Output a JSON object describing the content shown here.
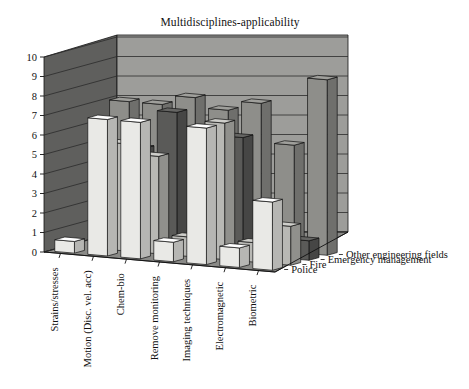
{
  "chart": {
    "title": "Multidisciplines-applicability",
    "type": "bar"
  },
  "chart_data": {
    "type": "bar",
    "title": "Multidisciplines-applicability",
    "xlabel": "",
    "ylabel": "",
    "ylim": [
      0,
      10
    ],
    "yticks": [
      0,
      1,
      2,
      3,
      4,
      5,
      6,
      7,
      8,
      9,
      10
    ],
    "grid": true,
    "projection": "3d",
    "legend_position": "right-depth-axis",
    "categories": [
      "Strains/stresses",
      "Motion (Disc. vel. acc)",
      "Chem-bio",
      "Remove monitoring",
      "Imaging techniques",
      "Electromagnetic",
      "Biometric"
    ],
    "series": [
      {
        "name": "Police",
        "color": "#e9e9e6",
        "values": [
          0.6,
          7.0,
          7.0,
          1.0,
          7.0,
          1.0,
          3.5
        ]
      },
      {
        "name": "Fire",
        "color": "#b8b8b4",
        "values": [
          0.0,
          5.5,
          5.0,
          1.0,
          7.0,
          1.0,
          2.0
        ]
      },
      {
        "name": "Emergency management",
        "color": "#5a5a58",
        "values": [
          0.0,
          5.0,
          7.0,
          1.5,
          6.0,
          1.0,
          1.0
        ]
      },
      {
        "name": "Other engineering fields",
        "color": "#8e8e8a",
        "values": [
          7.0,
          7.0,
          7.5,
          7.0,
          7.5,
          5.5,
          9.0
        ]
      }
    ]
  },
  "axes": {
    "y_ticks": [
      "10",
      "9",
      "8",
      "7",
      "6",
      "5",
      "4",
      "3",
      "2",
      "1",
      "0"
    ],
    "category_labels": [
      "Strains/stresses",
      "Motion (Disc. vel. acc)",
      "Chem-bio",
      "Remove monitoring",
      "Imaging techniques",
      "Electromagnetic",
      "Biometric"
    ],
    "series_labels": [
      "Other engineering fields",
      "Emergency management",
      "Fire",
      "Police"
    ]
  },
  "colors": {
    "back_wall": "#6f6f6d",
    "side_wall": "#5f5f5d",
    "floor": "#8a8a87",
    "grid_line": "#2d2d2d",
    "outline": "#111111"
  }
}
